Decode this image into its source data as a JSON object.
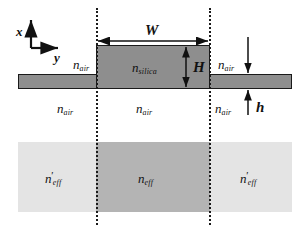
{
  "figure": {
    "type": "cross-section-schematic",
    "colors": {
      "silica_block": "#8e8e8e",
      "outline": "#1a1a1a",
      "band_outer": "#e4e4e4",
      "band_inner": "#b4b4b4",
      "background": "#ffffff"
    }
  },
  "axes": {
    "vertical_label": "x",
    "horizontal_label": "y"
  },
  "dimensions": {
    "width_label": "W",
    "height_label": "H",
    "slab_thickness_label": "h"
  },
  "indices": {
    "core": {
      "base": "n",
      "sub": "silica"
    },
    "cladding": {
      "base": "n",
      "sub": "air"
    },
    "effective_center": {
      "base": "n",
      "sub": "eff",
      "prime": ""
    },
    "effective_outer": {
      "base": "n",
      "sub": "eff",
      "prime": "'"
    }
  },
  "labels": {
    "n_air_top_left": {
      "base": "n",
      "sub": "air"
    },
    "n_air_bottom_left": {
      "base": "n",
      "sub": "air"
    },
    "n_air_bottom_center": {
      "base": "n",
      "sub": "air"
    },
    "n_air_top_right": {
      "base": "n",
      "sub": "air"
    },
    "n_air_bottom_right": {
      "base": "n",
      "sub": "air"
    },
    "n_silica_block": {
      "base": "n",
      "sub": "silica"
    },
    "n_eff_left": {
      "base": "n",
      "prime": "'",
      "sub": "eff"
    },
    "n_eff_center": {
      "base": "n",
      "sub": "eff"
    },
    "n_eff_right": {
      "base": "n",
      "prime": "'",
      "sub": "eff"
    }
  }
}
